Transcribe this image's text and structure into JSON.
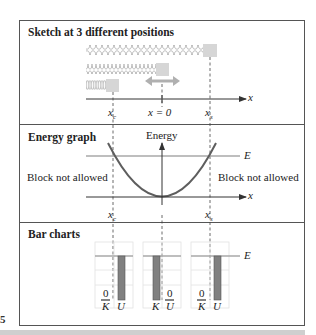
{
  "figure": {
    "page_number_fragment": "5",
    "sections": {
      "sketch": {
        "title": "Sketch at 3 different positions",
        "axis_label": "x",
        "positions": [
          "x_c",
          "x = 0",
          "x_s"
        ],
        "label_xc": "x",
        "label_xc_sub": "c",
        "label_x0": "x = 0",
        "label_xs": "x",
        "label_xs_sub": "s"
      },
      "energy": {
        "title": "Energy graph",
        "y_axis_label": "Energy",
        "x_axis_label": "x",
        "energy_line_label": "E",
        "left_region_label": "Block not allowed",
        "right_region_label": "Block not allowed",
        "label_xc": "x",
        "label_xc_sub": "c",
        "label_xs": "x",
        "label_xs_sub": "s"
      },
      "bars": {
        "title": "Bar charts",
        "energy_line_label": "E",
        "charts": [
          {
            "position": "x_c",
            "K_label": "K",
            "U_label": "U",
            "K_value_label": "0",
            "U_value_label": "",
            "K": 0,
            "U": 1
          },
          {
            "position": "x = 0",
            "K_label": "K",
            "U_label": "U",
            "K_value_label": "",
            "U_value_label": "0",
            "K": 1,
            "U": 0
          },
          {
            "position": "x_s",
            "K_label": "K",
            "U_label": "U",
            "K_value_label": "0",
            "U_value_label": "",
            "K": 0,
            "U": 1
          }
        ]
      }
    },
    "colors": {
      "frame": "#555555",
      "spring": "#c4c4c4",
      "block": "#d6d6d6",
      "arrow": "#b0b0b0",
      "curve": "#5e5e5e",
      "energy_line": "#a8a8a8",
      "bar": "#808080",
      "grid": "#e2e2e2"
    }
  }
}
